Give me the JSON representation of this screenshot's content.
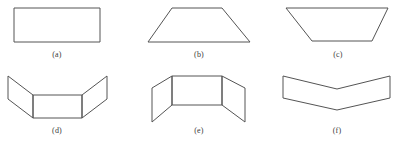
{
  "figure": {
    "width": 404,
    "height": 148,
    "background_color": "#ffffff",
    "stroke_color": "#545454",
    "caption_color": "#3a3a3a",
    "panels": [
      {
        "id": "a",
        "caption": "(a)",
        "caption_x": 57,
        "caption_y": 50,
        "shape_name": "rectangle",
        "polygons": [
          "14,8 100,8 100,42 14,42"
        ]
      },
      {
        "id": "b",
        "caption": "(b)",
        "caption_x": 199,
        "caption_y": 50,
        "shape_name": "trapezoid-narrow-top",
        "polygons": [
          "172,8 222,8 250,42 148,42"
        ]
      },
      {
        "id": "c",
        "caption": "(c)",
        "caption_x": 338,
        "caption_y": 50,
        "shape_name": "trapezoid-wide-top",
        "polygons": [
          "286,8 388,8 372,41 312,41"
        ]
      },
      {
        "id": "d",
        "caption": "(d)",
        "caption_x": 57,
        "caption_y": 126,
        "shape_name": "folded-panels-up",
        "polygons": [
          "33,95 82,95 82,118 33,118",
          "8,76 33,95 33,118 8,99",
          "107,76 107,99 82,118 82,95"
        ]
      },
      {
        "id": "e",
        "caption": "(e)",
        "caption_x": 199,
        "caption_y": 126,
        "shape_name": "folded-panels-down",
        "polygons": [
          "172,76 222,76 222,105 172,105",
          "152,88 172,76 172,105 152,122",
          "245,88 245,122 222,105 222,76"
        ]
      },
      {
        "id": "f",
        "caption": "(f)",
        "caption_x": 337,
        "caption_y": 126,
        "shape_name": "chevron-band",
        "polygons": [
          "283,76 337,89 390,76 390,98 337,110 283,98"
        ]
      }
    ]
  }
}
